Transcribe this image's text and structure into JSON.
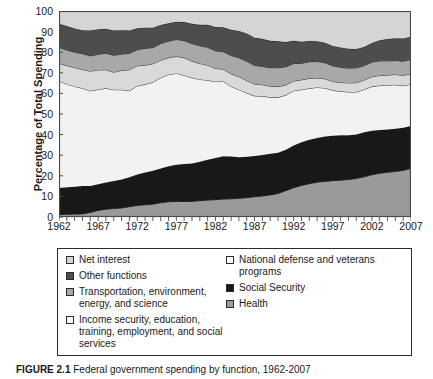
{
  "figure": {
    "caption_label": "FIGURE 2.1",
    "caption_text": "Federal government spending by function, 1962-2007"
  },
  "chart_data": {
    "type": "area",
    "stacked": true,
    "title": "",
    "xlabel": "",
    "ylabel": "Percentage of Total Spending",
    "xlim": [
      1962,
      2007
    ],
    "ylim": [
      0,
      100
    ],
    "grid": false,
    "legend_position": "below",
    "y_ticks": [
      0,
      10,
      20,
      30,
      40,
      50,
      60,
      70,
      80,
      90,
      100
    ],
    "x_ticks": [
      1962,
      1967,
      1972,
      1977,
      1982,
      1987,
      1992,
      1997,
      2002,
      2007
    ],
    "x": [
      1962,
      1963,
      1964,
      1965,
      1966,
      1967,
      1968,
      1969,
      1970,
      1971,
      1972,
      1973,
      1974,
      1975,
      1976,
      1977,
      1978,
      1979,
      1980,
      1981,
      1982,
      1983,
      1984,
      1985,
      1986,
      1987,
      1988,
      1989,
      1990,
      1991,
      1992,
      1993,
      1994,
      1995,
      1996,
      1997,
      1998,
      1999,
      2000,
      2001,
      2002,
      2003,
      2004,
      2005,
      2006,
      2007
    ],
    "series": [
      {
        "name": "Health",
        "color": "#9a9a9a",
        "values": [
          1.2,
          1.3,
          1.4,
          1.5,
          2.2,
          3.2,
          3.8,
          4.1,
          4.4,
          5.0,
          5.6,
          5.9,
          6.2,
          6.9,
          7.4,
          7.6,
          7.5,
          7.6,
          7.9,
          8.2,
          8.4,
          8.7,
          8.8,
          9.1,
          9.4,
          9.8,
          10.2,
          10.7,
          11.4,
          12.8,
          14.2,
          15.3,
          16.2,
          16.9,
          17.3,
          17.6,
          17.9,
          18.2,
          18.7,
          19.5,
          20.5,
          21.2,
          21.7,
          22.1,
          22.6,
          23.6
        ]
      },
      {
        "name": "Social Security",
        "color": "#181818",
        "values": [
          12.9,
          13.2,
          13.3,
          13.5,
          12.8,
          12.7,
          13.0,
          13.4,
          13.8,
          14.3,
          15.0,
          15.7,
          16.2,
          16.7,
          17.2,
          17.8,
          18.2,
          18.4,
          18.9,
          19.6,
          20.3,
          20.8,
          20.6,
          19.9,
          19.8,
          19.8,
          19.9,
          20.0,
          19.8,
          19.9,
          20.5,
          21.0,
          21.3,
          21.5,
          21.8,
          21.9,
          21.8,
          21.5,
          21.4,
          21.6,
          21.4,
          21.0,
          20.8,
          20.8,
          20.7,
          20.6
        ]
      },
      {
        "name": "Income security, education, training, employment, and social services",
        "color": "#f2f2f2",
        "values": [
          51.9,
          50.0,
          48.7,
          47.5,
          46.2,
          46.0,
          45.7,
          44.3,
          43.6,
          42.0,
          43.0,
          42.8,
          43.0,
          44.0,
          44.6,
          44.3,
          43.1,
          41.6,
          40.0,
          38.6,
          37.0,
          36.3,
          34.0,
          32.8,
          31.0,
          29.2,
          28.6,
          27.4,
          26.9,
          26.5,
          26.6,
          25.5,
          25.0,
          24.5,
          23.5,
          22.0,
          21.3,
          21.0,
          20.6,
          20.8,
          21.4,
          21.6,
          21.5,
          21.3,
          20.4,
          20.3
        ]
      },
      {
        "name": "Transportation, environment, energy, and science",
        "color": "#d9d9d9",
        "values": [
          8.6,
          9.0,
          9.1,
          9.1,
          9.6,
          9.5,
          9.0,
          8.5,
          9.4,
          10.2,
          9.8,
          9.3,
          9.0,
          8.5,
          8.1,
          8.3,
          8.5,
          8.1,
          7.7,
          7.3,
          6.4,
          6.0,
          6.1,
          6.3,
          6.0,
          5.7,
          5.5,
          5.4,
          5.2,
          4.9,
          4.7,
          4.8,
          4.8,
          4.6,
          4.5,
          4.3,
          4.3,
          4.4,
          4.5,
          4.6,
          4.8,
          4.9,
          4.9,
          5.0,
          5.0,
          5.1
        ]
      },
      {
        "name": "Other functions",
        "color": "#a8a8a8",
        "values": [
          7.7,
          7.6,
          7.5,
          7.7,
          7.4,
          7.6,
          8.0,
          8.2,
          7.9,
          7.9,
          7.8,
          8.2,
          7.8,
          8.1,
          8.0,
          8.2,
          8.3,
          8.5,
          8.6,
          8.7,
          8.6,
          8.5,
          8.9,
          9.2,
          9.4,
          9.1,
          8.9,
          9.0,
          9.2,
          8.8,
          8.5,
          8.0,
          8.1,
          8.0,
          7.8,
          7.6,
          7.4,
          7.2,
          7.2,
          7.0,
          7.1,
          7.1,
          6.9,
          6.8,
          6.9,
          6.9
        ]
      },
      {
        "name": "National defense and veterans programs",
        "color": "#4d4d4d",
        "values": [
          11.5,
          11.6,
          11.5,
          11.4,
          12.3,
          12.2,
          11.9,
          12.0,
          11.5,
          11.1,
          10.4,
          10.0,
          9.7,
          9.0,
          8.7,
          8.6,
          9.0,
          9.6,
          10.2,
          10.9,
          11.5,
          11.8,
          12.5,
          13.0,
          13.5,
          13.4,
          13.4,
          13.0,
          12.8,
          12.0,
          11.0,
          10.5,
          10.0,
          9.8,
          9.7,
          9.6,
          9.6,
          9.4,
          9.2,
          9.0,
          9.3,
          10.0,
          10.6,
          10.8,
          11.1,
          11.0
        ]
      },
      {
        "name": "Net interest",
        "color": "#d5d5d5",
        "values": [
          6.2,
          7.3,
          8.5,
          9.3,
          9.5,
          8.8,
          8.6,
          9.5,
          9.4,
          9.5,
          8.4,
          8.1,
          8.1,
          6.8,
          6.0,
          5.2,
          5.4,
          6.2,
          6.7,
          6.7,
          7.8,
          7.9,
          9.1,
          9.7,
          10.9,
          13.0,
          13.5,
          14.5,
          14.7,
          15.1,
          14.5,
          14.9,
          14.6,
          14.7,
          15.4,
          17.0,
          17.7,
          18.3,
          18.4,
          17.5,
          15.5,
          14.2,
          13.6,
          13.2,
          13.3,
          12.5
        ]
      }
    ]
  },
  "legend": {
    "columns": [
      {
        "items": [
          {
            "label": "Net interest",
            "color": "#d5d5d5",
            "name": "net-interest"
          },
          {
            "label": "Other functions",
            "color": "#4d4d4d",
            "name": "other-functions"
          },
          {
            "label": "Transportation, environment, energy, and science",
            "color": "#a8a8a8",
            "name": "transportation-environment-energy-science"
          },
          {
            "label": "Income security, education, training, employment, and social services",
            "color": "#ffffff",
            "name": "income-security-education-training-employment-social-services"
          }
        ]
      },
      {
        "items": [
          {
            "label": "National defense and veterans programs",
            "color": "#ffffff",
            "name": "national-defense-veterans-programs"
          },
          {
            "label": "Social Security",
            "color": "#181818",
            "name": "social-security"
          },
          {
            "label": "Health",
            "color": "#9a9a9a",
            "name": "health"
          }
        ]
      }
    ]
  }
}
